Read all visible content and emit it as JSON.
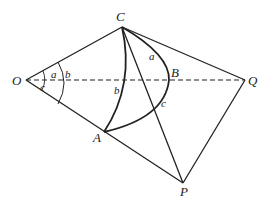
{
  "points": {
    "O": {
      "label": "O",
      "x": 26,
      "y": 80
    },
    "C": {
      "label": "C",
      "x": 122,
      "y": 27
    },
    "B": {
      "label": "B",
      "x": 169,
      "y": 80
    },
    "Q": {
      "label": "Q",
      "x": 245,
      "y": 80
    },
    "A": {
      "label": "A",
      "x": 104,
      "y": 132
    },
    "P": {
      "label": "P",
      "x": 183,
      "y": 183
    }
  },
  "arc_labels": {
    "a_angle": "a",
    "b_angle": "b",
    "c_angle": "c",
    "a_side": "a",
    "b_side": "b",
    "c_side": "c"
  },
  "colors": {
    "line": "#222222",
    "background": "#ffffff"
  }
}
